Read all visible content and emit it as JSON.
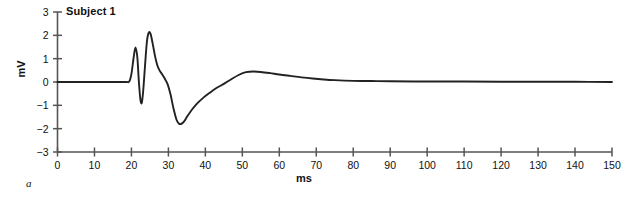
{
  "figure": {
    "panel_letter": "a",
    "annotation": "Subject 1"
  },
  "chart_data": {
    "type": "line",
    "title": "Subject 1",
    "xlabel": "ms",
    "ylabel": "mV",
    "xlim": [
      0,
      150
    ],
    "ylim": [
      -3,
      3
    ],
    "xticks": [
      0,
      10,
      20,
      30,
      40,
      50,
      60,
      70,
      80,
      90,
      100,
      110,
      120,
      130,
      140,
      150
    ],
    "yticks": [
      3,
      2,
      1,
      0,
      -1,
      -2,
      -3
    ],
    "grid": false,
    "legend": null,
    "line_color": "#222222",
    "axis_color": "#555555",
    "series": [
      {
        "name": "Subject 1",
        "x": [
          0,
          5,
          10,
          15,
          18.5,
          19.4,
          20.0,
          20.6,
          21.1,
          21.6,
          22.0,
          22.4,
          22.8,
          23.2,
          23.7,
          24.2,
          24.7,
          25.2,
          25.8,
          26.4,
          27.0,
          27.6,
          28.3,
          29.0,
          29.8,
          30.6,
          31.4,
          32.2,
          32.8,
          33.4,
          34.2,
          35.2,
          36.4,
          37.8,
          39.4,
          41.2,
          43.0,
          45.0,
          47.0,
          49.0,
          51.0,
          53.0,
          55.0,
          57.5,
          60.0,
          63.0,
          66.0,
          69.0,
          72.0,
          75.0,
          80.0,
          85.0,
          90.0,
          100.0,
          110.0,
          120.0,
          130.0,
          140.0,
          150.0
        ],
        "y": [
          0,
          0,
          0,
          0,
          0,
          0.02,
          0.35,
          1.05,
          1.48,
          1.05,
          0.05,
          -0.72,
          -0.9,
          -0.35,
          0.75,
          1.75,
          2.12,
          2.05,
          1.6,
          1.1,
          0.72,
          0.5,
          0.33,
          0.15,
          -0.1,
          -0.55,
          -1.15,
          -1.62,
          -1.78,
          -1.8,
          -1.7,
          -1.45,
          -1.18,
          -0.92,
          -0.68,
          -0.46,
          -0.26,
          -0.08,
          0.12,
          0.3,
          0.42,
          0.45,
          0.43,
          0.38,
          0.32,
          0.26,
          0.2,
          0.15,
          0.11,
          0.08,
          0.05,
          0.04,
          0.03,
          0.02,
          0.02,
          0.01,
          0.01,
          0.01,
          0.0
        ]
      }
    ]
  }
}
